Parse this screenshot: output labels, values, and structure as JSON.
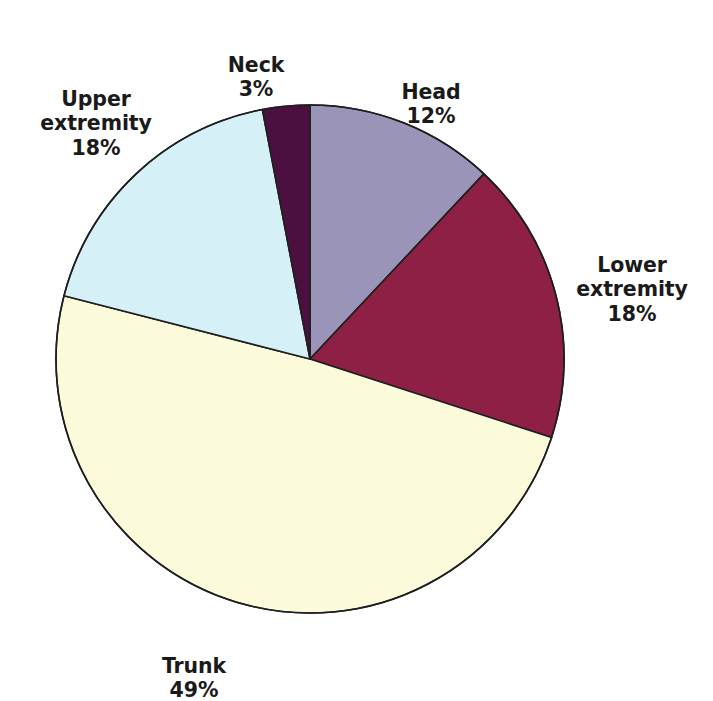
{
  "chart_data": {
    "type": "pie",
    "title": "",
    "categories": [
      "Head",
      "Lower extremity",
      "Trunk",
      "Upper extremity",
      "Neck"
    ],
    "values": [
      12,
      18,
      49,
      18,
      3
    ],
    "value_unit": "%",
    "start_angle_deg": 0,
    "direction": "clockwise",
    "legend": "none",
    "labels_position": "outside",
    "colors": [
      "#9a94b8",
      "#8d2044",
      "#fbfbdc",
      "#d6f0f7",
      "#4c1040"
    ],
    "slice_outline_color": "#1f1f1f",
    "background": "#ffffff",
    "slices": [
      {
        "name": "Head",
        "label": "Head",
        "percent_text": "12%",
        "value": 12,
        "color": "#9a94b8"
      },
      {
        "name": "Lower extremity",
        "label": "Lower\nextremity",
        "percent_text": "18%",
        "value": 18,
        "color": "#8d2044"
      },
      {
        "name": "Trunk",
        "label": "Trunk",
        "percent_text": "49%",
        "value": 49,
        "color": "#fbfbdc"
      },
      {
        "name": "Upper extremity",
        "label": "Upper\nextremity",
        "percent_text": "18%",
        "value": 18,
        "color": "#d6f0f7"
      },
      {
        "name": "Neck",
        "label": "Neck",
        "percent_text": "3%",
        "value": 3,
        "color": "#4c1040"
      }
    ]
  },
  "labels": {
    "neck": {
      "name": "Neck",
      "percent": "3%"
    },
    "head": {
      "name": "Head",
      "percent": "12%"
    },
    "upper": {
      "name": "Upper\nextremity",
      "percent": "18%"
    },
    "lower": {
      "name": "Lower\nextremity",
      "percent": "18%"
    },
    "trunk": {
      "name": "Trunk",
      "percent": "49%"
    }
  }
}
